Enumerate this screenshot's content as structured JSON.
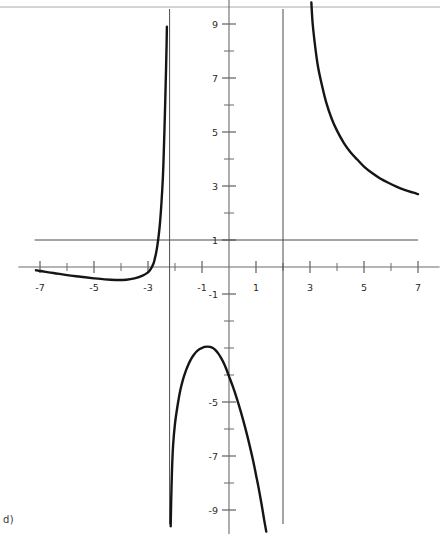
{
  "caption": "d)",
  "chart_data": {
    "type": "line",
    "title": "",
    "subtitle": "",
    "xlabel": "",
    "ylabel": "",
    "xlim": [
      -7.8,
      7.8
    ],
    "ylim": [
      -9.9,
      9.9
    ],
    "grid": false,
    "legend": "none",
    "axis_color": "#6b6b6b",
    "curve_color": "#151515",
    "asymptote_color": "#4a4a4a",
    "border_color": "#a8a8a8",
    "x_ticks": [
      -7,
      -6,
      -5,
      -4,
      -3,
      -2,
      -1,
      1,
      2,
      3,
      4,
      5,
      6,
      7
    ],
    "x_tick_labels": [
      "-7",
      "-5",
      "-3",
      "-1",
      "1",
      "3",
      "5",
      "7"
    ],
    "x_labeled_values": [
      -7,
      -5,
      -3,
      -1,
      1,
      3,
      5,
      7
    ],
    "y_ticks": [
      -9,
      -8,
      -7,
      -6,
      -5,
      -4,
      -3,
      -2,
      -1,
      1,
      2,
      3,
      4,
      5,
      6,
      7,
      8,
      9
    ],
    "y_tick_labels": [
      "9",
      "7",
      "5",
      "3",
      "1",
      "-1",
      "-5",
      "-7",
      "-9"
    ],
    "y_labeled_values": [
      9,
      7,
      5,
      3,
      1,
      -1,
      -5,
      -7,
      -9
    ],
    "vertical_asymptotes": [
      -2.2,
      2.0
    ],
    "horizontal_asymptote": 1,
    "horizontal_asymptote_span": [
      -7.2,
      7.0
    ],
    "annotations": [],
    "series": [
      {
        "name": "branch-left",
        "comment": "left tail approaching y=1 from below, rising steeply to +infinity at x=-2.2",
        "points": [
          [
            -7.15,
            -0.12
          ],
          [
            -7.0,
            -0.15
          ],
          [
            -6.5,
            -0.22
          ],
          [
            -6.0,
            -0.3
          ],
          [
            -5.5,
            -0.36
          ],
          [
            -5.0,
            -0.42
          ],
          [
            -4.6,
            -0.46
          ],
          [
            -4.2,
            -0.48
          ],
          [
            -3.8,
            -0.47
          ],
          [
            -3.5,
            -0.42
          ],
          [
            -3.2,
            -0.32
          ],
          [
            -3.0,
            -0.2
          ],
          [
            -2.9,
            -0.08
          ],
          [
            -2.8,
            0.12
          ],
          [
            -2.75,
            0.3
          ],
          [
            -2.7,
            0.52
          ],
          [
            -2.65,
            0.82
          ],
          [
            -2.6,
            1.2
          ],
          [
            -2.55,
            1.7
          ],
          [
            -2.5,
            2.4
          ],
          [
            -2.45,
            3.3
          ],
          [
            -2.42,
            4.1
          ],
          [
            -2.39,
            5.1
          ],
          [
            -2.36,
            6.2
          ],
          [
            -2.33,
            7.4
          ],
          [
            -2.31,
            8.3
          ],
          [
            -2.3,
            8.9
          ]
        ]
      },
      {
        "name": "branch-middle",
        "comment": "between the two vertical asymptotes; rises from -infinity, peaks near (-0.75, -2.95), falls to -infinity at x=2",
        "points": [
          [
            -2.16,
            -9.6
          ],
          [
            -2.14,
            -8.6
          ],
          [
            -2.11,
            -7.5
          ],
          [
            -2.07,
            -6.6
          ],
          [
            -2.0,
            -5.8
          ],
          [
            -1.9,
            -5.1
          ],
          [
            -1.8,
            -4.55
          ],
          [
            -1.7,
            -4.15
          ],
          [
            -1.6,
            -3.85
          ],
          [
            -1.5,
            -3.6
          ],
          [
            -1.4,
            -3.4
          ],
          [
            -1.3,
            -3.25
          ],
          [
            -1.2,
            -3.13
          ],
          [
            -1.1,
            -3.05
          ],
          [
            -1.0,
            -3.0
          ],
          [
            -0.9,
            -2.96
          ],
          [
            -0.8,
            -2.95
          ],
          [
            -0.7,
            -2.96
          ],
          [
            -0.6,
            -3.0
          ],
          [
            -0.5,
            -3.08
          ],
          [
            -0.4,
            -3.2
          ],
          [
            -0.3,
            -3.36
          ],
          [
            -0.2,
            -3.55
          ],
          [
            -0.1,
            -3.78
          ],
          [
            0.0,
            -4.05
          ],
          [
            0.15,
            -4.45
          ],
          [
            0.3,
            -4.9
          ],
          [
            0.45,
            -5.4
          ],
          [
            0.6,
            -5.95
          ],
          [
            0.75,
            -6.55
          ],
          [
            0.9,
            -7.2
          ],
          [
            1.0,
            -7.7
          ],
          [
            1.1,
            -8.2
          ],
          [
            1.2,
            -8.75
          ],
          [
            1.3,
            -9.35
          ],
          [
            1.38,
            -9.8
          ]
        ]
      },
      {
        "name": "branch-right",
        "comment": "right of x=2, descends from +infinity toward horizontal asymptote y=1",
        "points": [
          [
            3.05,
            9.8
          ],
          [
            3.1,
            9.0
          ],
          [
            3.2,
            8.1
          ],
          [
            3.3,
            7.4
          ],
          [
            3.45,
            6.7
          ],
          [
            3.6,
            6.1
          ],
          [
            3.8,
            5.5
          ],
          [
            4.0,
            5.05
          ],
          [
            4.25,
            4.6
          ],
          [
            4.5,
            4.25
          ],
          [
            4.75,
            3.98
          ],
          [
            5.0,
            3.72
          ],
          [
            5.3,
            3.48
          ],
          [
            5.6,
            3.28
          ],
          [
            5.9,
            3.12
          ],
          [
            6.2,
            2.98
          ],
          [
            6.5,
            2.86
          ],
          [
            6.8,
            2.76
          ],
          [
            7.0,
            2.7
          ]
        ]
      }
    ]
  }
}
